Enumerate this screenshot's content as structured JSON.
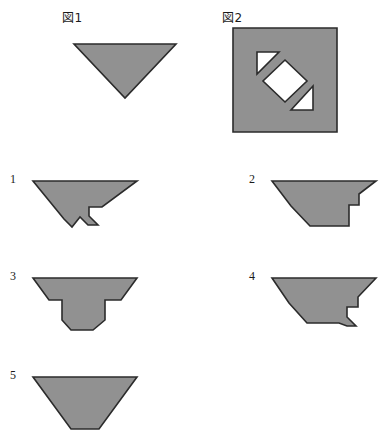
{
  "document": {
    "type": "geometry-multiple-choice",
    "language": "ja",
    "title": "",
    "background_color": "#ffffff"
  },
  "style": {
    "shape_fill": "#919191",
    "shape_stroke": "#2b2b2b",
    "cutout_fill": "#f2f2f0",
    "text_color": "#1a1a1a"
  },
  "figures": [
    {
      "id": "fig1",
      "label": "図1",
      "description": "inverted-triangle",
      "shape": {
        "type": "polygon",
        "viewbox": [
          0,
          0,
          106,
          58
        ],
        "points": "2,2 104,2 53,56",
        "cutouts": []
      }
    },
    {
      "id": "fig2",
      "label": "図2",
      "description": "gray-square-with-cutouts",
      "shape": {
        "type": "square-with-cutouts",
        "viewbox": [
          0,
          0,
          108,
          108
        ],
        "points": "2,2 106,2 106,106 2,106",
        "cutouts": [
          {
            "name": "top-left-triangle-hole",
            "points": "26,26 48,26 26,48"
          },
          {
            "name": "center-diamond-hole",
            "points": "54,34 76,55 54,76 32,55"
          },
          {
            "name": "bottom-right-triangle-hole",
            "points": "82,60 82,84 60,84"
          }
        ]
      }
    }
  ],
  "options": [
    {
      "number": "1",
      "id": "opt1",
      "description": "inverted triangle with stepped notch cut from lower right edge",
      "shape": {
        "type": "polygon",
        "viewbox": [
          0,
          0,
          110,
          60
        ],
        "points": "3,3 107,3 72,29 59,29 59,38 68,47 58,47 50,39 42,49 34,41"
      }
    },
    {
      "number": "2",
      "id": "opt2",
      "description": "truncated inverted triangle with small step notch on right side",
      "shape": {
        "type": "polygon",
        "viewbox": [
          0,
          0,
          110,
          60
        ],
        "points": "3,3 107,3 90,16 90,27 80,27 80,48 41,48 22,28"
      }
    },
    {
      "number": "3",
      "id": "opt3",
      "description": "truncated inverted triangle with notches on both sides forming a stem",
      "shape": {
        "type": "polygon",
        "viewbox": [
          0,
          0,
          110,
          60
        ],
        "points": "3,3 107,3 91,25 75,25 75,45 63,55 41,55 32,45 32,25 19,25"
      }
    },
    {
      "number": "4",
      "id": "opt4",
      "description": "truncated inverted triangle with deep notch cut from right side",
      "shape": {
        "type": "polygon",
        "viewbox": [
          0,
          0,
          110,
          60
        ],
        "points": "3,3 107,3 89,22 89,32 78,32 78,42 87,51 78,51 70,48 38,48 20,28"
      }
    },
    {
      "number": "5",
      "id": "opt5",
      "description": "plain truncated inverted triangle",
      "shape": {
        "type": "polygon",
        "viewbox": [
          0,
          0,
          110,
          60
        ],
        "points": "3,3 107,3 69,55 41,55"
      }
    }
  ]
}
